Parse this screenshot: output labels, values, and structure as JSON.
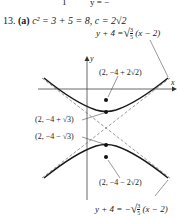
{
  "top_fragment": {
    "left": "1",
    "right": "y = −",
    "fraction_den": "4"
  },
  "problem": {
    "number": "13.",
    "part": "(a)",
    "text": "c² = 3 + 5 = 8, c = 2√2"
  },
  "equations": {
    "upper_asymptote": {
      "lhs": "y + 4 =",
      "num": "3",
      "den": "5",
      "rhs": "(x − 2)"
    },
    "lower_asymptote": {
      "lhs": "y + 4 = −",
      "num": "3",
      "den": "5",
      "rhs": "(x − 2)"
    }
  },
  "axes": {
    "x_label": "x",
    "y_label": "y"
  },
  "points": {
    "upper_focus": "(2, −4 + 2√2)",
    "upper_vertex": "(2, −4 + √3)",
    "lower_vertex": "(2, −4 − √3)",
    "lower_focus": "(2, −4 − 2√2)"
  }
}
